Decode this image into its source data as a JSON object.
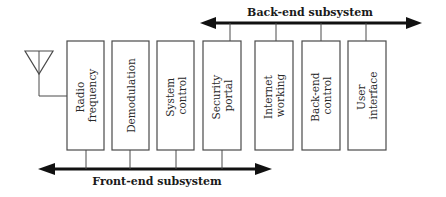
{
  "diagram": {
    "type": "block-diagram",
    "antenna": {
      "icon": "antenna-icon"
    },
    "buses": {
      "front_end": {
        "label": "Front-end subsystem",
        "direction": "bidirectional"
      },
      "back_end": {
        "label": "Back-end subsystem",
        "direction": "bidirectional"
      }
    },
    "blocks": [
      {
        "id": "radio-frequency",
        "lines": [
          "Radio",
          "frequency"
        ],
        "bus": "front_end"
      },
      {
        "id": "demodulation",
        "lines": [
          "Demodulation"
        ],
        "bus": "front_end"
      },
      {
        "id": "system-control",
        "lines": [
          "System",
          "control"
        ],
        "bus": "front_end"
      },
      {
        "id": "security-portal",
        "lines": [
          "Security",
          "portal"
        ],
        "bus": "both"
      },
      {
        "id": "internet-working",
        "lines": [
          "Internet",
          "working"
        ],
        "bus": "back_end"
      },
      {
        "id": "back-end-control",
        "lines": [
          "Back-end",
          "control"
        ],
        "bus": "back_end"
      },
      {
        "id": "user-interface",
        "lines": [
          "User",
          "interface"
        ],
        "bus": "back_end"
      }
    ]
  }
}
